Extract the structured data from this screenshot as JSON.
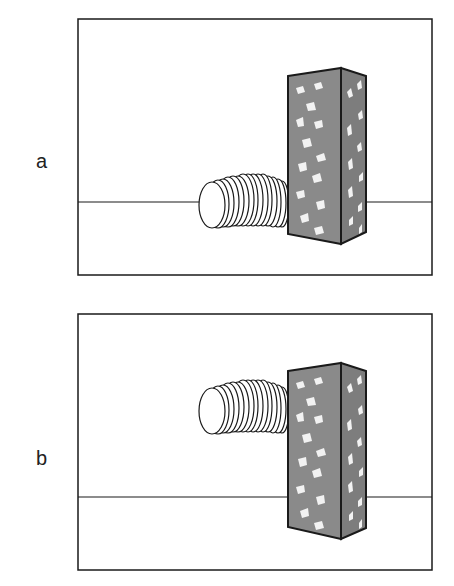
{
  "panels": [
    {
      "label": "a",
      "description": "Flexible tube lying on the ground, emerging from behind a speckled block"
    },
    {
      "label": "b",
      "description": "Flexible tube floating above the ground, emerging from behind a speckled block"
    }
  ],
  "colors": {
    "stroke": "#1a1a1a",
    "block_fill": "#8a8a8a",
    "block_side_fill": "#7d7d7d",
    "speckle": "#f2f2f2",
    "background": "#ffffff"
  }
}
